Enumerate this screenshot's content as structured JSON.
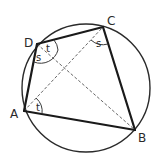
{
  "diagram": {
    "vertices": {
      "A": {
        "label": "A"
      },
      "B": {
        "label": "B"
      },
      "C": {
        "label": "C"
      },
      "D": {
        "label": "D"
      }
    },
    "sides": [
      "AB",
      "BC",
      "CD",
      "DA"
    ],
    "diagonals": [
      "AC",
      "DB"
    ],
    "angle_labels": {
      "angle_ADB": "s",
      "angle_BDC": "t",
      "angle_ACB": "s",
      "angle_BAC": "t"
    },
    "colors": {
      "stroke": "#1a1a1a",
      "diagonal": "#555555",
      "background": "#ffffff"
    }
  }
}
